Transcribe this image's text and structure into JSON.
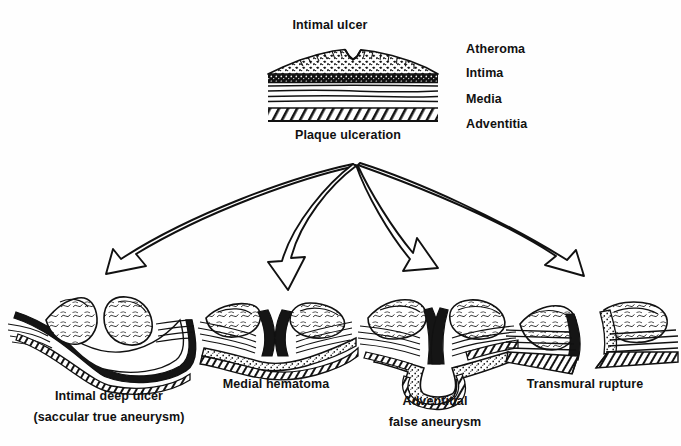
{
  "figure": {
    "title_top": "Intimal ulcer",
    "title_bottom": "Plaque ulceration",
    "wall_layers": [
      {
        "name": "Atheroma",
        "label": "Atheroma"
      },
      {
        "name": "Intima",
        "label": "Intima"
      },
      {
        "name": "Media",
        "label": "Media"
      },
      {
        "name": "Adventitia",
        "label": "Adventitia"
      }
    ],
    "outcomes": [
      {
        "id": "intimal-deep-ulcer",
        "line1": "Intimal deep ulcer",
        "line2": "(saccular true aneurysm)"
      },
      {
        "id": "medial-hematoma",
        "line1": "Medial hematoma",
        "line2": ""
      },
      {
        "id": "adventitial-false-aneurysm",
        "line1": "Adventitial",
        "line2": "false aneurysm"
      },
      {
        "id": "transmural-rupture",
        "line1": "Transmural rupture",
        "line2": ""
      }
    ],
    "colors": {
      "ink": "#111111",
      "background": "#fefefe",
      "stipple": "#1a1a1a"
    }
  }
}
